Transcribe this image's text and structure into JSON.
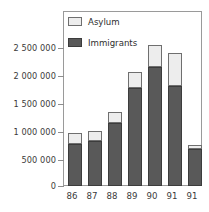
{
  "chart_data": {
    "type": "bar",
    "stacked": true,
    "title": "",
    "xlabel": "",
    "ylabel": "",
    "categories": [
      "86",
      "87",
      "88",
      "89",
      "90",
      "91",
      "91"
    ],
    "series": [
      {
        "name": "Immigrants",
        "color": "#595959",
        "values": [
          750000,
          810000,
          1120000,
          1750000,
          2120000,
          1780000,
          660000
        ]
      },
      {
        "name": "Asylum",
        "color": "#ededed",
        "values": [
          190000,
          180000,
          210000,
          280000,
          400000,
          590000,
          80000
        ]
      }
    ],
    "totals": [
      940000,
      990000,
      1330000,
      2030000,
      2520000,
      2370000,
      740000
    ],
    "ylim": [
      0,
      3125000
    ],
    "yticks": [
      0,
      500000,
      1000000,
      1500000,
      2000000,
      2500000
    ],
    "ytick_labels": [
      "0",
      "500 000",
      "1 000 000",
      "1 500 000",
      "2 000 000",
      "2 500 000"
    ],
    "grid": false,
    "legend_position": "top-left",
    "legend": [
      {
        "label": "Asylum",
        "swatch": "asylum"
      },
      {
        "label": "Immigrants",
        "swatch": "immigrants"
      }
    ]
  }
}
